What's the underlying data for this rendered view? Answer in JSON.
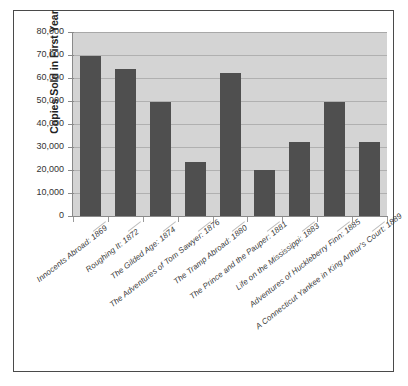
{
  "chart_data": {
    "type": "bar",
    "title": "",
    "xlabel": "",
    "ylabel": "Copies Sold in First Year",
    "ylim": [
      0,
      80000
    ],
    "grid": true,
    "legend": "none",
    "orientation": "vertical",
    "bar_color": "#4f4f4f",
    "plot_background": "#d4d4d4",
    "y_ticks": [
      0,
      10000,
      20000,
      30000,
      40000,
      50000,
      60000,
      70000,
      80000
    ],
    "y_tick_labels": [
      "0",
      "10,000",
      "20,000",
      "30,000",
      "40,000",
      "50,000",
      "60,000",
      "70,000",
      "80,000"
    ],
    "categories": [
      "Innocents Abroad: 1869",
      "Roughing It: 1872",
      "The Gilded Age: 1874",
      "The Adventures of Tom Sawyer: 1876",
      "The Tramp Abroad: 1880",
      "The Prince and the Pauper: 1881",
      "Life on the Mississippi: 1883",
      "Adventures of Huckleberry Finn: 1885",
      "A Connecticut Yankee in King Arthur's Court: 1889"
    ],
    "values": [
      69500,
      64000,
      49500,
      23500,
      62000,
      20000,
      32000,
      49500,
      32000
    ]
  }
}
